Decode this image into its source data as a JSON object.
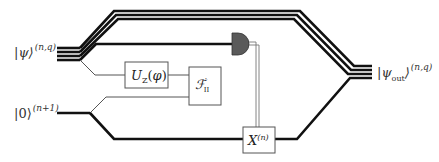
{
  "diagram": {
    "type": "quantum-circuit",
    "inputs": [
      {
        "id": "psi",
        "ket": "|ψ⟩",
        "superscript": "(n,q)",
        "wires": 4
      },
      {
        "id": "zero",
        "ket": "|0⟩",
        "superscript": "(n+1)",
        "wires": 1
      }
    ],
    "output": {
      "id": "psi_out",
      "ket": "|ψ",
      "subscript": "out",
      "ket_close": "⟩",
      "superscript": "(n,q)",
      "wires": 4
    },
    "gates": [
      {
        "id": "uz",
        "label": "U",
        "subscript": "Z",
        "arg": "(φ)"
      },
      {
        "id": "fii",
        "label": "𝓕′",
        "subscript": "II"
      },
      {
        "id": "x",
        "label": "X",
        "superscript": "(n)"
      }
    ],
    "measurement": {
      "id": "meter",
      "kind": "measurement",
      "controls": "x"
    },
    "colors": {
      "wire": "#111111",
      "thin_wire": "#555555",
      "box_stroke": "#555555",
      "meter_fill": "#5a5a5a",
      "classical": "#777777"
    }
  }
}
